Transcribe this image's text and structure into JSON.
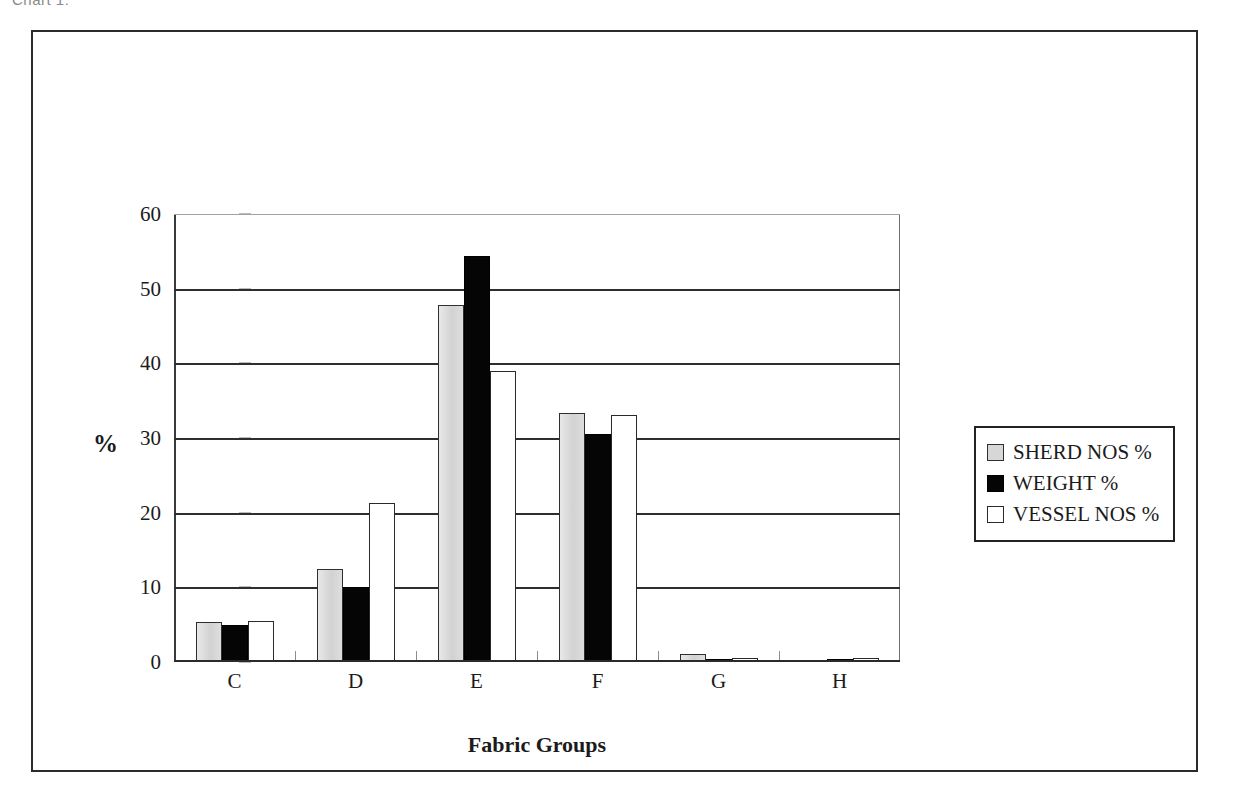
{
  "scan": {
    "caption_fragment": "Chart 1:"
  },
  "chart_data": {
    "type": "bar",
    "title": "",
    "xlabel": "Fabric Groups",
    "ylabel": "%",
    "categories": [
      "C",
      "D",
      "E",
      "F",
      "G",
      "H"
    ],
    "series": [
      {
        "name": "SHERD NOS %",
        "color": "#dcdcdc",
        "values": [
          5.3,
          12.4,
          47.8,
          33.4,
          1.1,
          0.0
        ]
      },
      {
        "name": "WEIGHT %",
        "color": "#050505",
        "values": [
          4.9,
          10.0,
          54.4,
          30.6,
          0.2,
          0.25
        ]
      },
      {
        "name": "VESSEL NOS %",
        "color": "#ffffff",
        "values": [
          5.5,
          21.3,
          39.0,
          33.1,
          0.5,
          0.5
        ]
      }
    ],
    "ylim": [
      0,
      60
    ],
    "yticks": [
      0,
      10,
      20,
      30,
      40,
      50,
      60
    ],
    "ytick_labels": [
      "0",
      "10",
      "20",
      "30",
      "40",
      "50",
      "60"
    ],
    "grid": true,
    "legend_position": "right"
  },
  "legend": {
    "entries": [
      {
        "label": "SHERD NOS %"
      },
      {
        "label": "WEIGHT %"
      },
      {
        "label": "VESSEL NOS %"
      }
    ]
  }
}
